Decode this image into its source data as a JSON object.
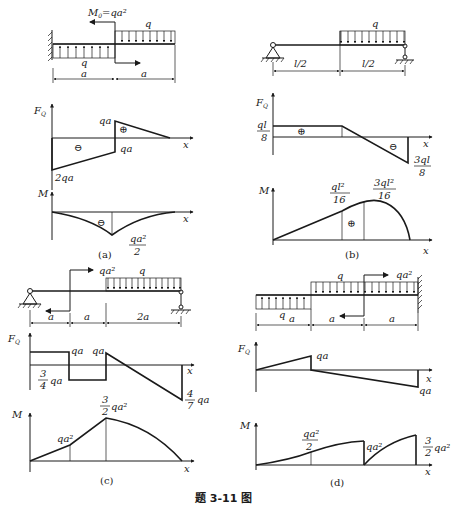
{
  "caption": "题 3-11 图",
  "panels": [
    {
      "id": "a",
      "label": "(a)",
      "beam": {
        "support": "fixed-left",
        "moment_label": "M",
        "moment_sub": "0",
        "moment_value": "=qa²",
        "load_left": "q",
        "load_right": "q",
        "dim_left": "a",
        "dim_right": "a"
      },
      "shear": {
        "axis": "F",
        "axis_sub": "Q",
        "x": "x",
        "labels": [
          "qa",
          "qa",
          "2qa"
        ],
        "signs": [
          "⊖",
          "⊕"
        ]
      },
      "moment": {
        "axis": "M",
        "x": "x",
        "label_num": "qa²",
        "label_den": "2",
        "sign": "⊖"
      }
    },
    {
      "id": "b",
      "label": "(b)",
      "beam": {
        "support": "pin-left, roller-right",
        "load": "q",
        "dim_left": "l/2",
        "dim_right": "l/2"
      },
      "shear": {
        "axis": "F",
        "axis_sub": "Q",
        "x": "x",
        "left_num": "ql",
        "left_den": "8",
        "right_num": "3ql",
        "right_den": "8",
        "signs": [
          "⊕",
          "⊖"
        ]
      },
      "moment": {
        "axis": "M",
        "x": "x",
        "mid_num": "ql²",
        "mid_den": "16",
        "max_num": "3ql²",
        "max_den": "16",
        "sign": "⊕"
      }
    },
    {
      "id": "c",
      "label": "(c)",
      "beam": {
        "support": "pin-left, roller-right",
        "moment_value": "qa²",
        "load": "q",
        "dims": [
          "a",
          "a",
          "2a"
        ]
      },
      "shear": {
        "axis": "F",
        "axis_sub": "Q",
        "x": "x",
        "labels": [
          "qa",
          "qa"
        ],
        "left_num": "3",
        "left_den": "4",
        "left_suffix": "qa",
        "right_num": "4",
        "right_den": "7",
        "right_suffix": "qa"
      },
      "moment": {
        "axis": "M",
        "x": "x",
        "label1": "qa²",
        "max_num": "3",
        "max_den": "2",
        "max_suffix": "qa²"
      }
    },
    {
      "id": "d",
      "label": "(d)",
      "beam": {
        "support": "fixed-right",
        "moment_value": "qa²",
        "load_top": "q",
        "load_bottom": "q",
        "dims": [
          "a",
          "a",
          "a"
        ]
      },
      "shear": {
        "axis": "F",
        "axis_sub": "Q",
        "x": "x",
        "label_top": "qa",
        "label_bottom": "qa"
      },
      "moment": {
        "axis": "M",
        "x": "x",
        "label1_num": "qa²",
        "label1_den": "2",
        "label2": "qa²",
        "label3_num": "3",
        "label3_den": "2",
        "label3_suffix": "qa²"
      }
    }
  ]
}
